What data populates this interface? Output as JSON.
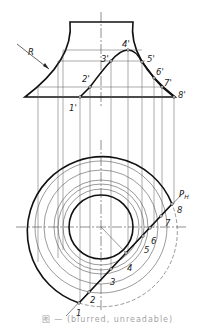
{
  "figure": {
    "type": "engineering drawing - section of a solid of revolution (concave frustum) by a plane",
    "front_view": {
      "radius_label": "R",
      "section_points": [
        {
          "label": "1'",
          "x": 80,
          "y": 97
        },
        {
          "label": "2'",
          "x": 90,
          "y": 87
        },
        {
          "label": "3'",
          "x": 111,
          "y": 61
        },
        {
          "label": "4'",
          "x": 128,
          "y": 50
        },
        {
          "label": "5'",
          "x": 142,
          "y": 62
        },
        {
          "label": "6'",
          "x": 154,
          "y": 78
        },
        {
          "label": "7'",
          "x": 162,
          "y": 87
        },
        {
          "label": "8'",
          "x": 174,
          "y": 97
        }
      ]
    },
    "top_view": {
      "plane_label": "P",
      "plane_subscript": "H",
      "section_points": [
        {
          "label": "1",
          "x": 78,
          "y": 304
        },
        {
          "label": "2",
          "x": 89,
          "y": 292
        },
        {
          "label": "3",
          "x": 111,
          "y": 269
        },
        {
          "label": "4",
          "x": 126,
          "y": 253
        },
        {
          "label": "5",
          "x": 143,
          "y": 236
        },
        {
          "label": "6",
          "x": 150,
          "y": 228
        },
        {
          "label": "7",
          "x": 161,
          "y": 216
        },
        {
          "label": "8",
          "x": 172,
          "y": 204
        }
      ]
    },
    "caption": "图 — (blurred, unreadable)"
  },
  "colors": {
    "line": "#1a1a1a",
    "thin": "#555555",
    "background": "#ffffff"
  }
}
